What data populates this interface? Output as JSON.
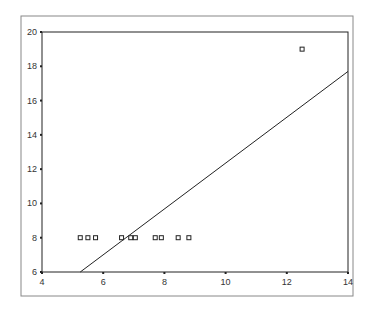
{
  "chart_data": {
    "type": "scatter",
    "title": "",
    "xlabel": "",
    "ylabel": "",
    "xlim": [
      4,
      14
    ],
    "ylim": [
      6,
      20
    ],
    "x_ticks": [
      4,
      6,
      8,
      10,
      12,
      14
    ],
    "y_ticks": [
      6,
      8,
      10,
      12,
      14,
      16,
      18,
      20
    ],
    "grid": false,
    "legend": null,
    "series": [
      {
        "name": "points",
        "marker": "open-square",
        "x": [
          5.25,
          5.5,
          5.75,
          6.6,
          6.9,
          7.05,
          7.7,
          7.9,
          8.45,
          8.8,
          12.5
        ],
        "y": [
          8,
          8,
          8,
          8,
          8,
          8,
          8,
          8,
          8,
          8,
          19
        ]
      },
      {
        "name": "fit line",
        "type": "line",
        "x": [
          5.25,
          14
        ],
        "y": [
          6,
          17.7
        ]
      }
    ]
  },
  "colors": {
    "axis": "#222222",
    "frame": "#888888",
    "marker": "#222222",
    "line": "#222222"
  }
}
